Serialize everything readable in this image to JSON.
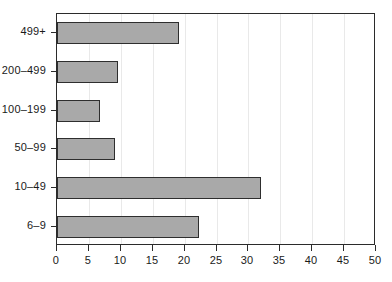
{
  "chart_data": {
    "type": "bar",
    "orientation": "horizontal",
    "title": "",
    "subtitle": "",
    "xlabel": "",
    "ylabel": "",
    "categories": [
      "6–9",
      "10–49",
      "50–99",
      "100–199",
      "200–499",
      "499+"
    ],
    "values": [
      22.3,
      32.0,
      9.1,
      6.7,
      9.6,
      19.1
    ],
    "xlim": [
      0,
      50
    ],
    "xticks": [
      0,
      5,
      10,
      15,
      20,
      25,
      30,
      35,
      40,
      45,
      50
    ],
    "xtick_labels": [
      "0",
      "5",
      "10",
      "15",
      "20",
      "25",
      "30",
      "35",
      "40",
      "45",
      "50"
    ],
    "ytick_labels": [
      "499+",
      "200–499",
      "100–199",
      "50–99",
      "10–49",
      "6–9"
    ],
    "grid": true,
    "grid_axis": "x",
    "legend": false,
    "legend_position": "none",
    "bar_fill_color": "#a9a9a9",
    "bar_edge_color": "#2e2e2e",
    "axis_color": "#2b2b2b",
    "gridline_color": "#e9e9e9",
    "background_color": "#ffffff",
    "bars_top_to_bottom": [
      {
        "category": "499+",
        "value": 19.1
      },
      {
        "category": "200–499",
        "value": 9.6
      },
      {
        "category": "100–199",
        "value": 6.7
      },
      {
        "category": "50–99",
        "value": 9.1
      },
      {
        "category": "10–49",
        "value": 32.0
      },
      {
        "category": "6–9",
        "value": 22.3
      }
    ]
  }
}
